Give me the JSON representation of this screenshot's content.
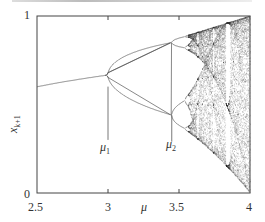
{
  "chart_data": {
    "type": "scatter",
    "title": "",
    "subtitle": "Bifurcation diagram of the logistic map x_{k+1} = mu x_k (1 - x_k)",
    "xlabel": "μ",
    "ylabel": "x_{k+1}",
    "ylabel_main": "x",
    "ylabel_sub": "k+1",
    "xlim": [
      2.5,
      4
    ],
    "ylim": [
      0,
      1
    ],
    "x_ticks": [
      2.5,
      3,
      3.5,
      4
    ],
    "x_tick_labels": [
      "2.5",
      "3",
      "3.5",
      "4"
    ],
    "y_ticks": [
      0,
      1
    ],
    "y_tick_labels": [
      "0",
      "1"
    ],
    "grid": false,
    "legend": null,
    "annotations": [
      {
        "label_main": "μ",
        "label_sub": "1",
        "x": 3.0,
        "y_top": 0.601,
        "y_bottom": 0.3,
        "description": "first period-doubling bifurcation"
      },
      {
        "label_main": "μ",
        "label_sub": "2",
        "x": 3.449,
        "y_top": 0.44,
        "y_bottom": 0.29,
        "description": "second period-doubling bifurcation"
      }
    ],
    "series": [
      {
        "name": "attractor",
        "description": "Fixed point x* = 1 - 1/μ for μ<3, period-2 for 3<μ<3.449, period-4 up to ~3.544, then cascade into chaos with periodic windows (e.g. period-3 near μ≈3.83)",
        "sample_points": [
          {
            "mu": 2.5,
            "x": [
              0.6
            ]
          },
          {
            "mu": 2.8,
            "x": [
              0.643
            ]
          },
          {
            "mu": 3.0,
            "x": [
              0.667
            ]
          },
          {
            "mu": 3.2,
            "x": [
              0.513,
              0.799
            ]
          },
          {
            "mu": 3.449,
            "x": [
              0.44,
              0.852
            ]
          },
          {
            "mu": 3.5,
            "x": [
              0.383,
              0.501,
              0.827,
              0.875
            ]
          },
          {
            "mu": 3.57,
            "x": "onset of chaos"
          },
          {
            "mu": 3.83,
            "x": [
              0.156,
              0.504,
              0.957
            ]
          },
          {
            "mu": 4.0,
            "x": "chaotic band [0, 1]"
          }
        ],
        "mu_min": 2.5,
        "mu_max": 4.0,
        "transient": 300,
        "samples_per_mu": 60
      }
    ]
  },
  "plot": {
    "left_px": 37,
    "right_px": 250,
    "top_px": 16,
    "bottom_px": 193,
    "line_color": "#555555",
    "axis_color": "#444444",
    "dot_color": "#3a3a3a"
  }
}
